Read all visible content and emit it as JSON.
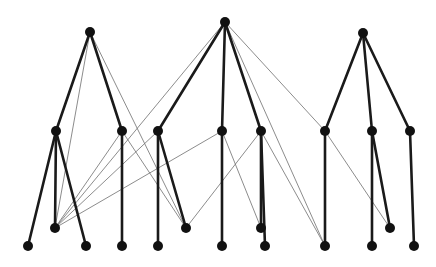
{
  "figure": {
    "title": "",
    "kind": "node-link-graph",
    "background_color": "#ffffff",
    "width": 436,
    "height": 267
  },
  "style": {
    "vertex_color": "#111111",
    "vertex_radius": 5,
    "thick_edge_color": "#1a1a1a",
    "thick_edge_width": 2.6,
    "thin_edge_color": "#6e6e6e",
    "thin_edge_width": 0.8
  },
  "chart_data": {
    "type": "graph",
    "title": "",
    "xlabel": "",
    "ylabel": "",
    "grid": false,
    "legend": "none",
    "layout": "layered",
    "node_count": 24,
    "edge_count": 35,
    "rows": {
      "apex_y": 32,
      "middle_y": 131,
      "intermediate_y": 228,
      "bottom_y": 246
    },
    "nodes": [
      {
        "id": "a1",
        "x": 90,
        "y": 32,
        "row": "apex"
      },
      {
        "id": "a2",
        "x": 225,
        "y": 22,
        "row": "apex"
      },
      {
        "id": "a3",
        "x": 363,
        "y": 33,
        "row": "apex"
      },
      {
        "id": "m1",
        "x": 56,
        "y": 131,
        "row": "middle"
      },
      {
        "id": "m2",
        "x": 122,
        "y": 131,
        "row": "middle"
      },
      {
        "id": "m3",
        "x": 158,
        "y": 131,
        "row": "middle"
      },
      {
        "id": "m4",
        "x": 222,
        "y": 131,
        "row": "middle"
      },
      {
        "id": "m5",
        "x": 261,
        "y": 131,
        "row": "middle"
      },
      {
        "id": "m6",
        "x": 325,
        "y": 131,
        "row": "middle"
      },
      {
        "id": "m7",
        "x": 372,
        "y": 131,
        "row": "middle"
      },
      {
        "id": "m8",
        "x": 410,
        "y": 131,
        "row": "middle"
      },
      {
        "id": "i1",
        "x": 55,
        "y": 228,
        "row": "intermediate"
      },
      {
        "id": "i2",
        "x": 186,
        "y": 228,
        "row": "intermediate"
      },
      {
        "id": "i3",
        "x": 261,
        "y": 228,
        "row": "intermediate"
      },
      {
        "id": "i4",
        "x": 390,
        "y": 228,
        "row": "intermediate"
      },
      {
        "id": "b1",
        "x": 28,
        "y": 246,
        "row": "bottom"
      },
      {
        "id": "b2",
        "x": 86,
        "y": 246,
        "row": "bottom"
      },
      {
        "id": "b3",
        "x": 122,
        "y": 246,
        "row": "bottom"
      },
      {
        "id": "b4",
        "x": 158,
        "y": 246,
        "row": "bottom"
      },
      {
        "id": "b5",
        "x": 222,
        "y": 246,
        "row": "bottom"
      },
      {
        "id": "b6",
        "x": 265,
        "y": 246,
        "row": "bottom"
      },
      {
        "id": "b7",
        "x": 325,
        "y": 246,
        "row": "bottom"
      },
      {
        "id": "b8",
        "x": 372,
        "y": 246,
        "row": "bottom"
      },
      {
        "id": "b9",
        "x": 414,
        "y": 246,
        "row": "bottom"
      }
    ],
    "edges_thick": [
      {
        "from": "a1",
        "to": "m1"
      },
      {
        "from": "a1",
        "to": "m2"
      },
      {
        "from": "a2",
        "to": "m3"
      },
      {
        "from": "a2",
        "to": "m4"
      },
      {
        "from": "a2",
        "to": "m5"
      },
      {
        "from": "a3",
        "to": "m6"
      },
      {
        "from": "a3",
        "to": "m7"
      },
      {
        "from": "a3",
        "to": "m8"
      },
      {
        "from": "m1",
        "to": "b1"
      },
      {
        "from": "m1",
        "to": "i1"
      },
      {
        "from": "m1",
        "to": "b2"
      },
      {
        "from": "m2",
        "to": "b3"
      },
      {
        "from": "m3",
        "to": "b4"
      },
      {
        "from": "m3",
        "to": "i2"
      },
      {
        "from": "m4",
        "to": "b5"
      },
      {
        "from": "m5",
        "to": "b6"
      },
      {
        "from": "m5",
        "to": "i3"
      },
      {
        "from": "m6",
        "to": "b7"
      },
      {
        "from": "m7",
        "to": "b8"
      },
      {
        "from": "m7",
        "to": "i4"
      },
      {
        "from": "m8",
        "to": "b9"
      }
    ],
    "edges_thin": [
      {
        "from": "a1",
        "to": "i2"
      },
      {
        "from": "a1",
        "to": "i1"
      },
      {
        "from": "a2",
        "to": "i1"
      },
      {
        "from": "a2",
        "to": "m6"
      },
      {
        "from": "a2",
        "to": "b7"
      },
      {
        "from": "m2",
        "to": "i1"
      },
      {
        "from": "m2",
        "to": "i2"
      },
      {
        "from": "m3",
        "to": "i1"
      },
      {
        "from": "m4",
        "to": "i3"
      },
      {
        "from": "m5",
        "to": "i2"
      },
      {
        "from": "m6",
        "to": "i4"
      },
      {
        "from": "m7",
        "to": "i4"
      },
      {
        "from": "b7",
        "to": "m5"
      },
      {
        "from": "i1",
        "to": "m4"
      }
    ]
  }
}
